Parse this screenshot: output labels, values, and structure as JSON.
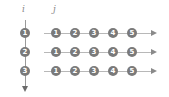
{
  "labels": {
    "i": "i",
    "j": "j"
  },
  "rows": [
    {
      "i": "1",
      "j": [
        "1",
        "2",
        "3",
        "4",
        "5"
      ]
    },
    {
      "i": "2",
      "j": [
        "1",
        "2",
        "3",
        "4",
        "5"
      ]
    },
    {
      "i": "3",
      "j": [
        "1",
        "2",
        "3",
        "4",
        "5"
      ]
    }
  ],
  "colors": {
    "node": "#7a7a7a",
    "line": "#b8b8b8",
    "text": "#ffffff"
  }
}
